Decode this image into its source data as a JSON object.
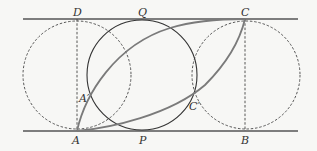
{
  "diagram": {
    "labels": {
      "D": "D",
      "Q": "Q",
      "C": "C",
      "A_prime": "A′",
      "C_prime": "C′",
      "A": "A",
      "P": "P",
      "B": "B"
    },
    "colors": {
      "line": "#555555",
      "curve": "#7a7a7a",
      "dashed": "#444444",
      "background": "#f7f7f5"
    }
  }
}
